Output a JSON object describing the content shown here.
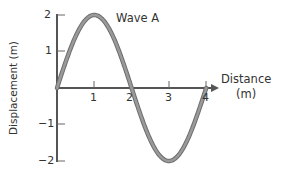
{
  "chart_data": {
    "type": "line",
    "title": "",
    "series": [
      {
        "name": "Wave A",
        "x": [
          0,
          0.25,
          0.5,
          0.75,
          1,
          1.25,
          1.5,
          1.75,
          2,
          2.25,
          2.5,
          2.75,
          3,
          3.25,
          3.5,
          3.75,
          4
        ],
        "values": [
          0,
          0.77,
          1.41,
          1.85,
          2,
          1.85,
          1.41,
          0.77,
          0,
          -0.77,
          -1.41,
          -1.85,
          -2,
          -1.85,
          -1.41,
          -0.77,
          0
        ]
      }
    ],
    "xlabel": "Distance (m)",
    "ylabel": "Displacement (m)",
    "xlim": [
      0,
      4
    ],
    "ylim": [
      -2,
      2
    ],
    "xticks": [
      1,
      2,
      3,
      4
    ],
    "yticks": [
      2,
      1,
      -1,
      -2
    ],
    "grid": false,
    "annotations": [
      "Wave A"
    ],
    "amplitude": 2,
    "wavelength": 4,
    "line_color": "#8a8a8a",
    "axis_color": "#555555"
  },
  "labels": {
    "wave_name": "Wave A",
    "x_axis_title_line1": "Distance",
    "x_axis_title_line2": "(m)",
    "y_axis_title": "Displacement (m)",
    "xtick_1": "1",
    "xtick_2": "2",
    "xtick_3": "3",
    "xtick_4": "4",
    "ytick_2": "2",
    "ytick_1": "1",
    "ytick_m1": "−1",
    "ytick_m2": "−2"
  }
}
